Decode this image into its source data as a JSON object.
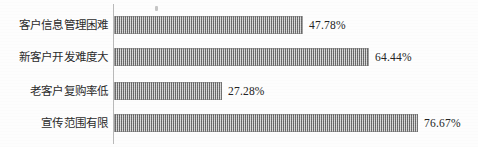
{
  "chart_data": {
    "type": "bar",
    "orientation": "horizontal",
    "title": "",
    "subtitle": "",
    "xlabel": "",
    "ylabel": "",
    "grid": false,
    "legend": null,
    "legend_position": "none",
    "xlim": [
      0,
      100
    ],
    "axis_line_color": "#b9b9b9",
    "bar_color": "#9a9a9a",
    "bar_fill_pattern": "vertical-hatch",
    "value_suffix": "%",
    "categories": [
      "客户信息管理困难",
      "新客户开发难度大",
      "老客户复购率低",
      "宣传范围有限"
    ],
    "values": [
      47.78,
      64.44,
      27.28,
      76.67
    ],
    "value_labels": [
      "47.78%",
      "64.44%",
      "27.28%",
      "76.67%"
    ],
    "bars": [
      {
        "category": "客户信息管理困难",
        "value": 47.78,
        "value_label": "47.78%"
      },
      {
        "category": "新客户开发难度大",
        "value": 64.44,
        "value_label": "64.44%"
      },
      {
        "category": "老客户复购率低",
        "value": 27.28,
        "value_label": "27.28%"
      },
      {
        "category": "宣传范围有限",
        "value": 76.67,
        "value_label": "76.67%"
      }
    ]
  }
}
